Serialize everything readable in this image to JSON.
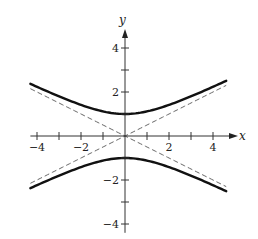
{
  "chart_data": {
    "type": "line",
    "title": "",
    "xlabel": "x",
    "ylabel": "y",
    "xlim": [
      -4.3,
      4.6
    ],
    "ylim": [
      -4.4,
      4.9
    ],
    "grid": false,
    "x_ticks": [
      -4,
      -3,
      -2,
      -1,
      1,
      2,
      3,
      4
    ],
    "x_tick_labels": [
      "-4",
      "-2",
      "2",
      "4"
    ],
    "x_tick_label_values": [
      -4,
      -2,
      2,
      4
    ],
    "y_ticks": [
      -4,
      -3,
      -2,
      -1,
      1,
      2,
      3,
      4
    ],
    "y_tick_labels": [
      "4",
      "2",
      "-2",
      "-4"
    ],
    "y_tick_label_values": [
      4,
      2,
      -2,
      -4
    ],
    "equation": "y^2 - x^2/4 = 1",
    "series": [
      {
        "name": "upper branch",
        "style": "solid",
        "expr": "sqrt(1 + x^2/4)",
        "x_range": [
          -4.3,
          4.6
        ]
      },
      {
        "name": "lower branch",
        "style": "solid",
        "expr": "-sqrt(1 + x^2/4)",
        "x_range": [
          -4.3,
          4.6
        ]
      },
      {
        "name": "asymptote y = x/2",
        "style": "dashed",
        "expr": "x/2",
        "x_range": [
          -4.3,
          4.6
        ]
      },
      {
        "name": "asymptote y = -x/2",
        "style": "dashed",
        "expr": "-x/2",
        "x_range": [
          -4.3,
          4.6
        ]
      }
    ],
    "sample_points": {
      "x": [
        -4,
        -2,
        0,
        2,
        4
      ],
      "upper": [
        2.24,
        1.41,
        1.0,
        1.41,
        2.24
      ],
      "lower": [
        -2.24,
        -1.41,
        -1.0,
        -1.41,
        -2.24
      ]
    }
  },
  "labels": {
    "x_axis": "x",
    "y_axis": "y"
  }
}
